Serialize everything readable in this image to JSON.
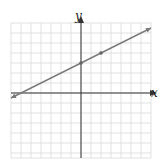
{
  "chart_data": {
    "type": "line",
    "title": "",
    "xlabel": "x",
    "ylabel": "y",
    "xlim": [
      -7,
      7
    ],
    "ylim": [
      -6.5,
      7
    ],
    "grid": true,
    "grid_step": 1,
    "tick_labels": false,
    "series": [
      {
        "name": "line",
        "equation": "y = (1/2)x + 3",
        "x": [
          -7,
          7
        ],
        "y": [
          -0.5,
          6.5
        ],
        "marked_points": [
          {
            "x": 0,
            "y": 3
          },
          {
            "x": 2,
            "y": 4
          }
        ],
        "arrows_both_ends": true
      }
    ]
  },
  "labels": {
    "x_axis": "x",
    "y_axis": "y"
  },
  "colors": {
    "grid": "#d9d9d9",
    "axis": "#333333",
    "line": "#7a7a7a",
    "point": "#666666"
  }
}
